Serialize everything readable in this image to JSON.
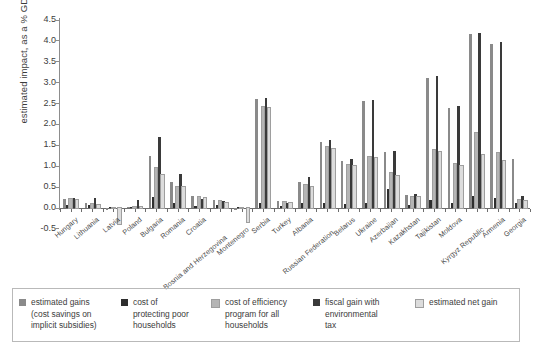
{
  "chart_data": {
    "type": "bar",
    "title": "",
    "xlabel": "",
    "ylabel": "estimated impact, as a % GDP",
    "ylim": [
      -0.5,
      4.5
    ],
    "ytick_labels": [
      "4.5",
      "4.0",
      "3.5",
      "3.0",
      "2.5",
      "2.0",
      "1.5",
      "1.0",
      "0.5",
      "0.0",
      "-0.5"
    ],
    "ytick_values": [
      4.5,
      4.0,
      3.5,
      3.0,
      2.5,
      2.0,
      1.5,
      1.0,
      0.5,
      0.0,
      -0.5
    ],
    "grid": false,
    "legend_position": "bottom",
    "categories": [
      "Hungary",
      "Lithuania",
      "Latvia",
      "Poland",
      "Bulgaria",
      "Romania",
      "Croatia",
      "Bosnia and Herzegovina",
      "Montenegro",
      "Serbia",
      "Turkey",
      "Albania",
      "Russian Federation",
      "Belarus",
      "Ukraine",
      "Azerbaijan",
      "Kazakhstan",
      "Tajikistan",
      "Moldova",
      "Kyrgyz Republic",
      "Armenia",
      "Georgia"
    ],
    "series": [
      {
        "name": "estimated gains (cost savings on implicit subsidies)",
        "color": "#8a8a8a",
        "values": [
          0.2,
          0.1,
          -0.05,
          0.02,
          1.23,
          0.62,
          0.28,
          0.18,
          -0.05,
          2.6,
          0.15,
          0.62,
          1.58,
          1.12,
          2.55,
          1.32,
          0.3,
          3.1,
          2.38,
          4.15,
          3.92,
          1.15
        ]
      },
      {
        "name": "cost of protecting poor households",
        "color": "#2e2e2e",
        "values": [
          0.05,
          0.05,
          0.02,
          0.02,
          0.25,
          0.1,
          0.04,
          0.05,
          0.02,
          0.1,
          0.03,
          0.1,
          0.12,
          0.08,
          0.12,
          0.45,
          0.05,
          0.18,
          0.1,
          0.28,
          0.22,
          0.1
        ]
      },
      {
        "name": "cost of efficiency program for all households",
        "color": "#b5b5b5",
        "values": [
          0.2,
          0.08,
          -0.02,
          0.01,
          0.95,
          0.48,
          0.25,
          0.15,
          -0.02,
          2.4,
          0.13,
          0.55,
          1.45,
          1.02,
          1.22,
          0.82,
          0.26,
          1.38,
          1.05,
          1.78,
          1.3,
          0.18
        ]
      },
      {
        "name": "fiscal gain with environmental tax",
        "color": "#3a3a3a",
        "values": [
          0.22,
          0.22,
          0.0,
          0.18,
          1.68,
          0.8,
          0.2,
          0.15,
          0.0,
          2.62,
          0.1,
          0.72,
          1.62,
          1.15,
          2.58,
          1.35,
          0.32,
          3.15,
          2.42,
          4.18,
          3.95,
          0.28
        ]
      },
      {
        "name": "estimated net gain",
        "color": "#dcdcdc",
        "values": [
          0.18,
          0.05,
          -0.4,
          0.02,
          0.78,
          0.5,
          0.22,
          0.12,
          -0.35,
          2.38,
          0.12,
          0.5,
          1.4,
          1.0,
          1.18,
          0.75,
          0.25,
          1.32,
          1.0,
          1.25,
          1.12,
          0.15
        ]
      }
    ]
  },
  "legend": {
    "items": [
      {
        "label": "estimated gains (cost savings on implicit subsidies)",
        "color": "#8a8a8a"
      },
      {
        "label": "cost of protecting poor households",
        "color": "#2e2e2e"
      },
      {
        "label": "cost of efficiency program for all households",
        "color": "#b5b5b5"
      },
      {
        "label": "fiscal gain with environmental tax",
        "color": "#3a3a3a"
      },
      {
        "label": "estimated net gain",
        "color": "#dcdcdc"
      }
    ]
  }
}
